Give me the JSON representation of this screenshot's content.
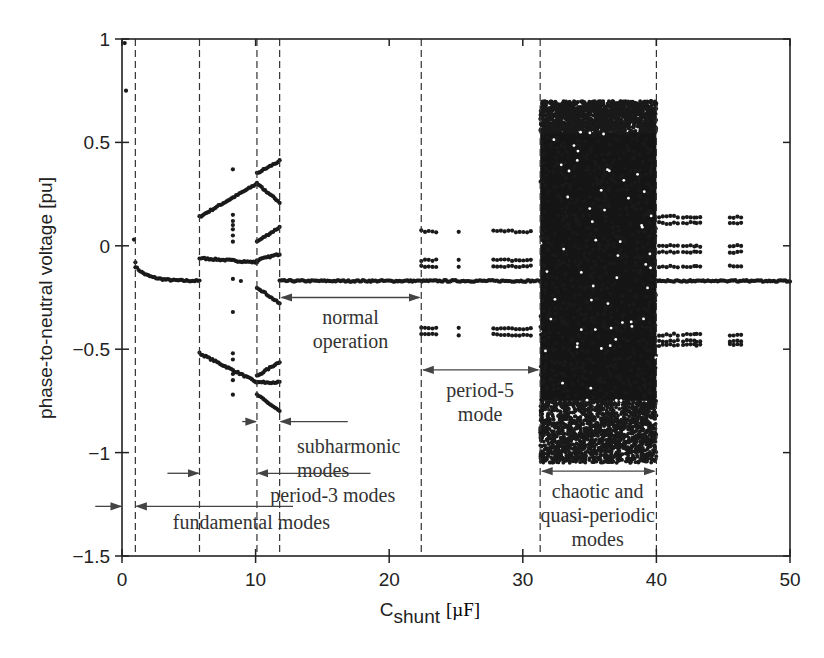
{
  "chart_data": {
    "type": "scatter",
    "title": "",
    "xlabel": "C_shunt [µF]",
    "xlabel_main": "C",
    "xlabel_sub": "shunt",
    "xlabel_unit": "[µF]",
    "ylabel": "phase-to-neutral voltage [pu]",
    "xlim": [
      0,
      50
    ],
    "ylim": [
      -1.5,
      1
    ],
    "xticks": [
      0,
      10,
      20,
      30,
      40,
      50
    ],
    "xtick_labels": [
      "0",
      "10",
      "20",
      "30",
      "40",
      "50"
    ],
    "yticks": [
      1,
      0.5,
      0,
      -0.5,
      -1,
      -1.5
    ],
    "ytick_labels": [
      "1",
      "0.5",
      "0",
      "−0.5",
      "−1",
      "−1.5"
    ],
    "grid": false,
    "legend": null,
    "region_boundaries": [
      1.0,
      5.8,
      10.1,
      11.8,
      22.4,
      31.3,
      40.0
    ],
    "series": [
      {
        "name": "fundamental transient",
        "points": [
          [
            0.2,
            0.98
          ],
          [
            0.3,
            0.75
          ],
          [
            0.9,
            0.03
          ],
          [
            1.0,
            -0.08
          ]
        ]
      },
      {
        "name": "fundamental mode",
        "x_range": [
          1.0,
          5.8
        ],
        "y_start": -0.1,
        "y_end": -0.17
      },
      {
        "name": "subharmonic upper",
        "x_range": [
          5.8,
          10.1
        ],
        "y_start": 0.14,
        "y_end": 0.3
      },
      {
        "name": "subharmonic middle",
        "x_range": [
          5.8,
          10.1
        ],
        "y_start": -0.06,
        "y_end": -0.08
      },
      {
        "name": "subharmonic lower",
        "x_range": [
          5.8,
          10.1
        ],
        "y_start": -0.52,
        "y_end": -0.66
      },
      {
        "name": "period-3 branch 1",
        "x_range": [
          10.1,
          11.8
        ],
        "y_start": 0.35,
        "y_end": 0.41
      },
      {
        "name": "period-3 branch 2",
        "x_range": [
          10.1,
          11.8
        ],
        "y_start": 0.3,
        "y_end": 0.21
      },
      {
        "name": "period-3 branch 3",
        "x_range": [
          10.1,
          11.8
        ],
        "y_start": 0.02,
        "y_end": 0.09
      },
      {
        "name": "period-3 branch 4",
        "x_range": [
          10.1,
          11.8
        ],
        "y_start": -0.07,
        "y_end": -0.04
      },
      {
        "name": "period-3 branch 5",
        "x_range": [
          10.1,
          11.8
        ],
        "y_start": -0.2,
        "y_end": -0.28
      },
      {
        "name": "period-3 branch 6",
        "x_range": [
          10.1,
          11.8
        ],
        "y_start": -0.63,
        "y_end": -0.56
      },
      {
        "name": "period-3 branch 7",
        "x_range": [
          10.1,
          11.8
        ],
        "y_start": -0.66,
        "y_end": -0.66
      },
      {
        "name": "period-3 branch 8",
        "x_range": [
          10.1,
          11.8
        ],
        "y_start": -0.72,
        "y_end": -0.8
      },
      {
        "name": "scattered subharmonic",
        "points": [
          [
            8.3,
            0.37
          ],
          [
            8.3,
            0.15
          ],
          [
            8.3,
            0.12
          ],
          [
            8.3,
            0.1
          ],
          [
            8.3,
            0.08
          ],
          [
            8.3,
            0.05
          ],
          [
            8.3,
            0.02
          ],
          [
            8.3,
            -0.16
          ],
          [
            8.9,
            -0.17
          ],
          [
            8.3,
            -0.32
          ],
          [
            8.3,
            -0.52
          ],
          [
            8.3,
            -0.55
          ],
          [
            8.3,
            -0.62
          ],
          [
            8.3,
            -0.65
          ],
          [
            8.3,
            -0.72
          ]
        ]
      },
      {
        "name": "normal operation",
        "x_range": [
          11.8,
          31.3
        ],
        "y_start": -0.17,
        "y_end": -0.17
      },
      {
        "name": "period-5 levels",
        "x_ranges": [
          [
            22.4,
            23.6
          ],
          [
            25.2,
            25.4
          ],
          [
            27.8,
            30.7
          ]
        ],
        "y_levels": [
          0.07,
          -0.07,
          -0.1,
          -0.4,
          -0.43
        ]
      },
      {
        "name": "chaotic band",
        "x_range": [
          31.3,
          40.0
        ],
        "y_range": [
          -1.05,
          0.7
        ]
      },
      {
        "name": "post-chaos normal",
        "x_range": [
          40.0,
          50.0
        ],
        "y_start": -0.17,
        "y_end": -0.17
      },
      {
        "name": "post-chaos multi-period",
        "x_ranges": [
          [
            40.2,
            41.6
          ],
          [
            42.0,
            43.0
          ],
          [
            43.0,
            43.3
          ],
          [
            45.5,
            46.5
          ]
        ],
        "y_levels": [
          0.14,
          0.11,
          0.0,
          -0.03,
          -0.1,
          -0.43,
          -0.46,
          -0.48
        ]
      }
    ],
    "annotations": [
      {
        "text": "normal\noperation",
        "arrow_x": [
          11.8,
          22.4
        ],
        "arrow_y": -0.25,
        "text_x": 17.1,
        "text_y": -0.38
      },
      {
        "text": "period-5\nmode",
        "arrow_x": [
          22.4,
          31.3
        ],
        "arrow_y": -0.6,
        "text_x": 26.8,
        "text_y": -0.73
      },
      {
        "text": "subharmonic\nmodes",
        "arrow_pair": [
          9.0,
          10.1,
          11.8,
          16.9
        ],
        "arrow_y": -0.85,
        "text_x": 13.1,
        "text_y": -1.0
      },
      {
        "text": "period-3 modes",
        "arrow_pair": [
          3.4,
          5.8,
          10.1,
          18.6
        ],
        "arrow_y": -1.1,
        "text_x": 11.1,
        "text_y": -1.24
      },
      {
        "text": "fundamental modes",
        "arrow_pair": [
          -2.0,
          0.0,
          1.0,
          12.8
        ],
        "arrow_y": -1.26,
        "text_x": 3.8,
        "text_y": -1.37
      },
      {
        "text": "chaotic and\nquasi-periodic\nmodes",
        "arrow_x": [
          31.3,
          40.0
        ],
        "arrow_y": -1.09,
        "text_x": 35.6,
        "text_y": -1.22
      }
    ]
  }
}
